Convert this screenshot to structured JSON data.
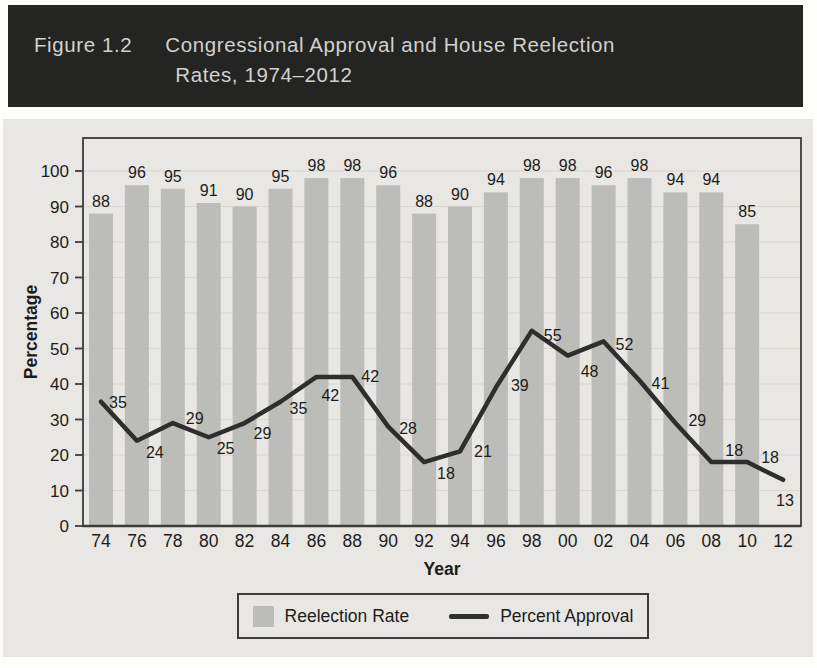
{
  "figure": {
    "label": "Figure 1.2",
    "title_line1": "Congressional Approval and House Reelection",
    "title_line2": "Rates, 1974–2012"
  },
  "chart_data": {
    "type": "combo",
    "title": "Congressional Approval and House Reelection Rates, 1974–2012",
    "categories": [
      "74",
      "76",
      "78",
      "80",
      "82",
      "84",
      "86",
      "88",
      "90",
      "92",
      "94",
      "96",
      "98",
      "00",
      "02",
      "04",
      "06",
      "08",
      "10",
      "12"
    ],
    "series": [
      {
        "name": "Reelection Rate",
        "type": "bar",
        "values": [
          88,
          96,
          95,
          91,
          90,
          95,
          98,
          98,
          96,
          88,
          90,
          94,
          98,
          98,
          96,
          98,
          94,
          94,
          85,
          null
        ]
      },
      {
        "name": "Percent Approval",
        "type": "line",
        "values": [
          35,
          24,
          29,
          25,
          29,
          35,
          42,
          42,
          28,
          18,
          21,
          39,
          55,
          48,
          52,
          41,
          29,
          18,
          18,
          13
        ]
      }
    ],
    "xlabel": "Year",
    "ylabel": "Percentage",
    "ylim": [
      0,
      100
    ],
    "yticks": [
      0,
      10,
      20,
      30,
      40,
      50,
      60,
      70,
      80,
      90,
      100
    ],
    "grid": true,
    "data_labels": true,
    "legend_position": "bottom"
  },
  "colors": {
    "title_bar_bg": "#242422",
    "title_bar_text": "#d2d1cf",
    "panel_bg": "#e9e7e3",
    "bar_fill": "#bcbcb9",
    "line_color": "#2e2e2e",
    "grid_color": "#d9d6d0",
    "axis_color": "#3c3c3c",
    "text_color": "#1c1c1c"
  }
}
